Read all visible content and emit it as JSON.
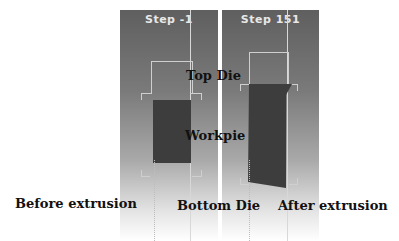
{
  "panels": [
    {
      "id": "before",
      "step_label": "Step  -1"
    },
    {
      "id": "after",
      "step_label": "Step  151"
    }
  ],
  "labels": {
    "top_die": "Top Die",
    "workpiece": "Workpie",
    "bottom_die": "Bottom Die",
    "before": "Before extrusion",
    "after": "After extrusion"
  },
  "colors": {
    "workpiece": "#3d3d3d",
    "outline": "#d0d0d0",
    "panel_top": "#5f5f5f"
  }
}
